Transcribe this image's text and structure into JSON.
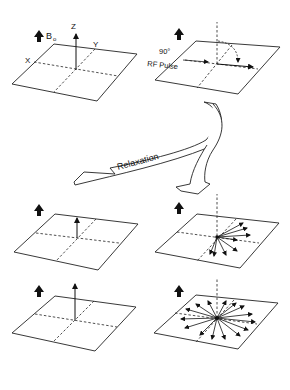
{
  "figure": {
    "type": "MRI magnetization relaxation diagram",
    "labels": {
      "field": "B",
      "field_sub": "o",
      "axis_z": "Z",
      "axis_y": "Y",
      "axis_x": "X",
      "pulse_line1": "90°",
      "pulse_line2": "RF Pulse",
      "process": "Relaxation"
    },
    "panels": [
      {
        "id": "equilibrium",
        "position": "top-left",
        "vector": "up (Z)"
      },
      {
        "id": "after-90-pulse",
        "position": "top-right",
        "vector": "in-plane (Y)"
      },
      {
        "id": "partial-relaxation-longitudinal",
        "position": "middle-left",
        "vector": "small up"
      },
      {
        "id": "partial-dephasing",
        "position": "middle-right",
        "vector": "fanning in-plane"
      },
      {
        "id": "full-relaxation-longitudinal",
        "position": "bottom-left",
        "vector": "full up"
      },
      {
        "id": "full-dephasing",
        "position": "bottom-right",
        "vector": "spread all directions"
      }
    ],
    "colors": {
      "line": "#222222",
      "background": "#ffffff"
    }
  }
}
